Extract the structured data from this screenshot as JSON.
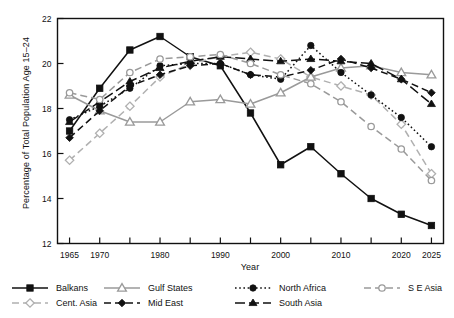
{
  "chart_data": {
    "type": "line",
    "title": "",
    "xlabel": "Year",
    "ylabel": "Percentage of Total Population Age 15–24",
    "xlim": [
      1963,
      2027
    ],
    "ylim": [
      12,
      22
    ],
    "yticks": [
      12,
      14,
      16,
      18,
      20,
      22
    ],
    "ytick_labels": [
      "12",
      "14",
      "16",
      "18",
      "20",
      "22"
    ],
    "xticks": [
      1965,
      1970,
      1975,
      1980,
      1985,
      1990,
      1995,
      2000,
      2005,
      2010,
      2015,
      2020,
      2025
    ],
    "xtick_labels": [
      "1965",
      "1970",
      "",
      "1980",
      "",
      "1990",
      "",
      "2000",
      "",
      "2010",
      "",
      "2020",
      "2025"
    ],
    "grid": false,
    "legend_position": "below-plot",
    "x": [
      1965,
      1970,
      1975,
      1980,
      1985,
      1990,
      1995,
      2000,
      2005,
      2010,
      2015,
      2020,
      2025
    ],
    "series": [
      {
        "name": "Balkans",
        "color": "#111111",
        "dash": "none",
        "marker": "filled-square",
        "values": [
          17.0,
          18.9,
          20.6,
          21.2,
          20.3,
          19.9,
          17.8,
          15.5,
          16.3,
          15.1,
          14.0,
          13.3,
          12.8
        ]
      },
      {
        "name": "Cent. Asia",
        "color": "#b0b0b0",
        "dash": "dashed",
        "marker": "open-diamond",
        "values": [
          15.7,
          16.9,
          18.1,
          19.4,
          20.0,
          20.3,
          20.5,
          20.2,
          19.4,
          19.0,
          18.6,
          17.3,
          15.1
        ]
      },
      {
        "name": "Gulf States",
        "color": "#9a9a9a",
        "dash": "none",
        "marker": "open-triangle",
        "values": [
          18.6,
          17.9,
          17.4,
          17.4,
          18.3,
          18.4,
          18.2,
          18.7,
          19.4,
          19.8,
          19.9,
          19.6,
          19.5
        ]
      },
      {
        "name": "Mid East",
        "color": "#111111",
        "dash": "dashed",
        "marker": "filled-diamond",
        "values": [
          16.7,
          17.9,
          19.0,
          19.5,
          19.9,
          20.0,
          19.5,
          19.4,
          19.7,
          20.2,
          19.8,
          19.3,
          18.7
        ]
      },
      {
        "name": "North Africa",
        "color": "#111111",
        "dash": "dotted",
        "marker": "filled-circle",
        "values": [
          17.5,
          18.1,
          18.9,
          19.9,
          20.0,
          20.0,
          19.5,
          19.3,
          20.8,
          19.6,
          18.6,
          17.6,
          16.3
        ]
      },
      {
        "name": "South Asia",
        "color": "#111111",
        "dash": "long-dash",
        "marker": "filled-triangle",
        "values": [
          17.4,
          18.3,
          19.2,
          19.8,
          20.1,
          20.3,
          20.2,
          20.1,
          20.2,
          20.1,
          20.0,
          19.3,
          18.2
        ]
      },
      {
        "name": "S E Asia",
        "color": "#9a9a9a",
        "dash": "dashed",
        "marker": "open-circle",
        "values": [
          18.7,
          18.4,
          19.6,
          20.2,
          20.3,
          20.4,
          20.0,
          19.5,
          19.1,
          18.3,
          17.2,
          16.2,
          14.8
        ]
      }
    ]
  },
  "legend": {
    "entries": [
      {
        "label": "Balkans"
      },
      {
        "label": "Cent. Asia"
      },
      {
        "label": "Gulf States"
      },
      {
        "label": "Mid East"
      },
      {
        "label": "North Africa"
      },
      {
        "label": "South Asia"
      },
      {
        "label": "S E Asia"
      }
    ]
  }
}
